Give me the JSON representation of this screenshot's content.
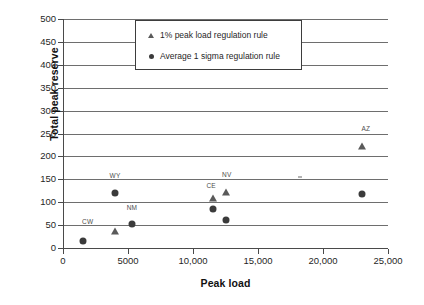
{
  "chart_data": {
    "type": "scatter",
    "title": "",
    "xlabel": "Peak load",
    "ylabel": "Total peak reserve",
    "xlim": [
      0,
      25000
    ],
    "ylim": [
      0,
      500
    ],
    "xticks": [
      "0",
      "5000",
      "10,000",
      "15,000",
      "20,000",
      "25,000"
    ],
    "xtick_values": [
      0,
      5000,
      10000,
      15000,
      20000,
      25000
    ],
    "yticks": [
      "0",
      "50",
      "100",
      "150",
      "200",
      "250",
      "300",
      "350",
      "400",
      "450",
      "500"
    ],
    "ytick_values": [
      0,
      50,
      100,
      150,
      200,
      250,
      300,
      350,
      400,
      450,
      500
    ],
    "grid": "horizontal",
    "legend_position": "top-center",
    "series": [
      {
        "name": "1% peak load regulation rule",
        "marker": "triangle",
        "color": "#5a5a5a",
        "points": [
          {
            "label": "NM",
            "x": 4000,
            "y": 38
          },
          {
            "label": "CE",
            "x": 11500,
            "y": 110
          },
          {
            "label": "NV",
            "x": 12500,
            "y": 122
          },
          {
            "label": "AZ",
            "x": 23000,
            "y": 222
          }
        ]
      },
      {
        "name": "Average 1 sigma regulation rule",
        "marker": "circle",
        "color": "#3b3b3b",
        "points": [
          {
            "label": "CW",
            "x": 1500,
            "y": 16
          },
          {
            "label": "WY",
            "x": 4000,
            "y": 121
          },
          {
            "label": "NM",
            "x": 5300,
            "y": 52
          },
          {
            "label": "",
            "x": 11500,
            "y": 85
          },
          {
            "label": "",
            "x": 12500,
            "y": 62
          },
          {
            "label": "",
            "x": 23000,
            "y": 117
          }
        ]
      }
    ],
    "point_labels": [
      {
        "text": "CW",
        "x": 1900,
        "y": 50
      },
      {
        "text": "WY",
        "x": 4000,
        "y": 150
      },
      {
        "text": "NM",
        "x": 5300,
        "y": 80
      },
      {
        "text": "CE",
        "x": 11400,
        "y": 128
      },
      {
        "text": "NV",
        "x": 12600,
        "y": 152
      },
      {
        "text": "AZ",
        "x": 23300,
        "y": 254
      }
    ]
  },
  "legend": {
    "entries": [
      {
        "marker": "triangle",
        "label": "1% peak load regulation rule"
      },
      {
        "marker": "circle",
        "label": "Average 1 sigma regulation rule"
      }
    ]
  }
}
